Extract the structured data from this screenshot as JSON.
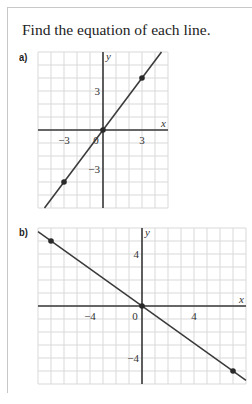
{
  "prompt": "Find the equation of each line.",
  "parts": [
    {
      "label": "a)"
    },
    {
      "label": "b)"
    }
  ],
  "colors": {
    "grid": "#d9d9d9",
    "axis": "#3a3a3a",
    "line": "#3a3a3a",
    "point": "#2a2a2a",
    "frame": "#c8c8c8"
  },
  "chart_data": [
    {
      "type": "line",
      "title": "a)",
      "xlabel": "x",
      "ylabel": "y",
      "xlim": [
        -5,
        5
      ],
      "ylim": [
        -6,
        6
      ],
      "grid": true,
      "x_ticks": [
        -3,
        0,
        3
      ],
      "y_ticks": [
        3,
        -3
      ],
      "tick_labels": {
        "x": [
          "-3",
          "0",
          "3"
        ],
        "y": [
          "3",
          "-3"
        ]
      },
      "points": [
        [
          -3,
          -4
        ],
        [
          0,
          0
        ],
        [
          3,
          4
        ]
      ],
      "line": {
        "slope": 1.3333,
        "intercept": 0
      }
    },
    {
      "type": "line",
      "title": "b)",
      "xlabel": "x",
      "ylabel": "y",
      "xlim": [
        -8,
        8
      ],
      "ylim": [
        -6,
        6
      ],
      "grid": true,
      "x_ticks": [
        -4,
        0,
        4
      ],
      "y_ticks": [
        4,
        -4
      ],
      "tick_labels": {
        "x": [
          "-4",
          "0",
          "4"
        ],
        "y": [
          "4",
          "-4"
        ]
      },
      "points": [
        [
          -7,
          5
        ],
        [
          0,
          0
        ],
        [
          7,
          -5
        ]
      ],
      "line": {
        "slope": -0.7143,
        "intercept": 0
      }
    }
  ]
}
